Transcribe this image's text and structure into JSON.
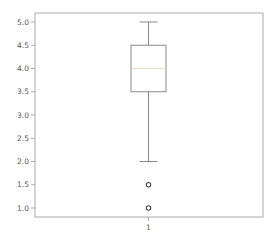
{
  "chart_data": {
    "type": "box",
    "title": "",
    "xlabel": "",
    "ylabel": "",
    "categories": [
      "1"
    ],
    "series": [
      {
        "name": "1",
        "whisker_low": 2.0,
        "q1": 3.5,
        "median": 4.0,
        "q3": 4.5,
        "whisker_high": 5.0,
        "outliers": [
          1.5,
          1.0
        ]
      }
    ],
    "yticks": [
      "1.0",
      "1.5",
      "2.0",
      "2.5",
      "3.0",
      "3.5",
      "4.0",
      "4.5",
      "5.0"
    ],
    "ytick_values": [
      1.0,
      1.5,
      2.0,
      2.5,
      3.0,
      3.5,
      4.0,
      4.5,
      5.0
    ],
    "xticks": [
      "1"
    ],
    "ylim": [
      0.8,
      5.2
    ],
    "grid": false,
    "legend": null
  },
  "colors": {
    "frame": "#aaaaaa",
    "box": "#888888",
    "median": "#e6e0cf",
    "outlier": "#444444",
    "tick_label": "#555555"
  }
}
